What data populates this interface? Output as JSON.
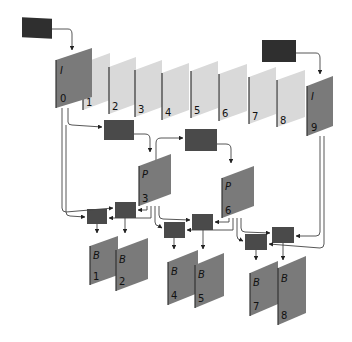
{
  "diagram": {
    "colors": {
      "background": "#ffffff",
      "source_box": "#2f2f2f",
      "encoder_box": "#4a4a4a",
      "i_frame": "#7a7a7a",
      "p_frame": "#7a7a7a",
      "b_frame": "#7a7a7a",
      "raw_frame": "#d9d9d9",
      "frame_edge": "#333333",
      "wire": "#444444"
    },
    "raw_frames": [
      {
        "index": "1"
      },
      {
        "index": "2"
      },
      {
        "index": "3"
      },
      {
        "index": "4"
      },
      {
        "index": "5"
      },
      {
        "index": "6"
      },
      {
        "index": "7"
      },
      {
        "index": "8"
      }
    ],
    "i_frames": [
      {
        "type": "I",
        "index": "0"
      },
      {
        "type": "I",
        "index": "9"
      }
    ],
    "p_frames": [
      {
        "type": "P",
        "index": "3"
      },
      {
        "type": "P",
        "index": "6"
      }
    ],
    "b_frames": [
      {
        "type": "B",
        "index": "1"
      },
      {
        "type": "B",
        "index": "2"
      },
      {
        "type": "B",
        "index": "4"
      },
      {
        "type": "B",
        "index": "5"
      },
      {
        "type": "B",
        "index": "7"
      },
      {
        "type": "B",
        "index": "8"
      }
    ]
  }
}
